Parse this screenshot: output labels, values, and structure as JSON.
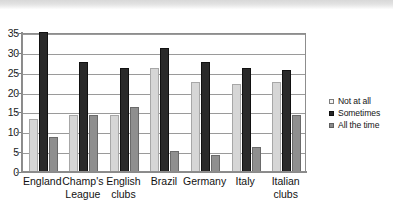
{
  "chart_data": {
    "type": "bar",
    "title": "",
    "subtitle": "",
    "xlabel": "",
    "ylabel": "",
    "ylim": [
      0,
      35
    ],
    "ytick_step": 5,
    "yticks": [
      "0",
      "5",
      "10",
      "15",
      "20",
      "25",
      "30",
      "35"
    ],
    "grid": true,
    "grid_axis": "y",
    "legend_position": "right",
    "categories": [
      "England",
      "Champ's League",
      "English clubs",
      "Brazil",
      "Germany",
      "Italy",
      "Italian clubs"
    ],
    "category_lines": [
      [
        "England"
      ],
      [
        "Champ's",
        "League"
      ],
      [
        "English",
        "clubs"
      ],
      [
        "Brazil"
      ],
      [
        "Germany"
      ],
      [
        "Italy"
      ],
      [
        "Italian",
        "clubs"
      ]
    ],
    "series": [
      {
        "name": "Not at all",
        "color": "#d6d6d6",
        "values": [
          13,
          14,
          14,
          26,
          22.5,
          22,
          22.5
        ]
      },
      {
        "name": "Sometimes",
        "color": "#2a2a2a",
        "values": [
          35,
          27.5,
          26,
          31,
          27.5,
          26,
          25.5
        ]
      },
      {
        "name": "All the time",
        "color": "#8f8f8f",
        "values": [
          8.5,
          14,
          16,
          5,
          4,
          6,
          14
        ]
      }
    ]
  },
  "legend": {
    "items": [
      {
        "label": "Not at all"
      },
      {
        "label": "Sometimes"
      },
      {
        "label": "All the time"
      }
    ]
  }
}
